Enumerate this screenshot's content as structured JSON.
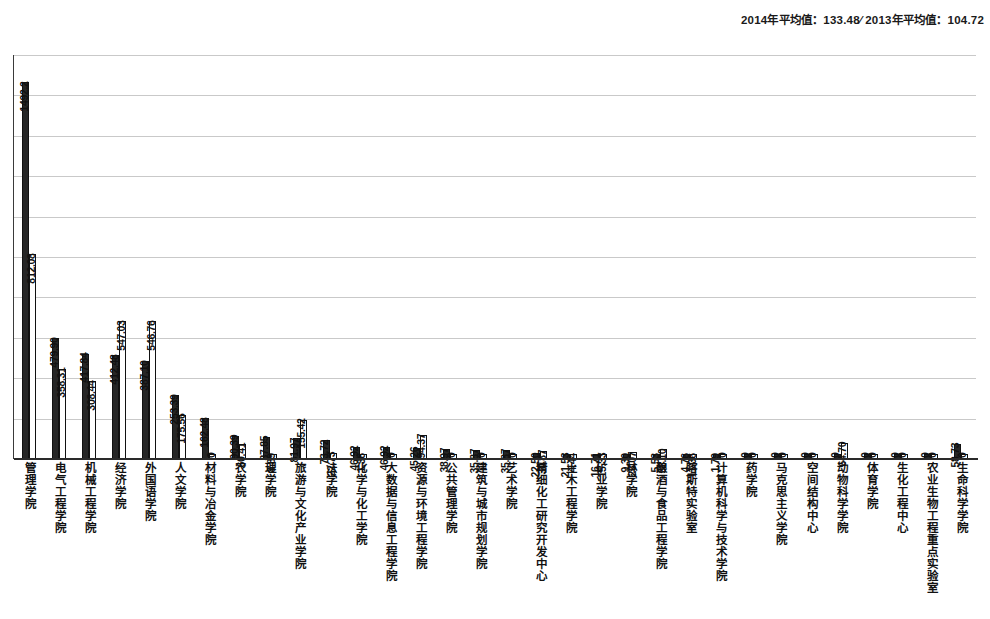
{
  "header": {
    "note": "2014年平均值：133.48∕ 2013年平均值：104.72"
  },
  "chart_data": {
    "type": "bar",
    "title": "",
    "subtitle": "",
    "xlabel": "",
    "ylabel": "",
    "grid": true,
    "legend_position": "none",
    "ylim": [
      0,
      1600
    ],
    "gridline_count": 10,
    "categories": [
      "管理学院",
      "电气工程学院",
      "机械工程学院",
      "经济学院",
      "外国语学院",
      "人文学院",
      "材料与冶金学院",
      "农学院",
      "理学院",
      "旅游与文化产业学院",
      "法学院",
      "化学与化工学院",
      "大数据与信息工程学院",
      "资源与环境工程学院",
      "公共管理学院",
      "建筑与城市规划学院",
      "艺术学院",
      "精细化工研究开发中心",
      "土木工程学院",
      "矿业学院",
      "林学院",
      "酿酒与食品工程学院",
      "喀斯特实验室",
      "计算机科学与技术学院",
      "药学院",
      "马克思主义学院",
      "空间结构中心",
      "动物科学学院",
      "体育学院",
      "生化工程中心",
      "农业生物工程重点实验室",
      "生命科学学院"
    ],
    "series": [
      {
        "name": "2014年",
        "average": 133.48,
        "values": [
          1492.2,
          479.9,
          417.84,
          412.48,
          387.1,
          253.39,
          162.48,
          90.39,
          87.85,
          81.97,
          73.72,
          46.92,
          46.92,
          45.26,
          38.97,
          35.87,
          35.87,
          22.5,
          21.53,
          16.71,
          9.3,
          5.53,
          4.76,
          1.79,
          0,
          0,
          0,
          0,
          0,
          0,
          0,
          58.73
        ]
      },
      {
        "name": "2013年",
        "average": 104.72,
        "values": [
          812.08,
          358.31,
          308.44,
          547.03,
          546.76,
          175.56,
          0,
          60.41,
          8.89,
          155.42,
          22.73,
          1.36,
          0,
          94.37,
          0,
          0,
          0,
          30.87,
          4.44,
          15.33,
          26.07,
          38.1,
          11.36,
          0,
          0,
          0,
          0,
          64.7,
          0,
          0,
          0,
          0
        ]
      }
    ],
    "value_labels_2014": [
      "1492.2",
      "479.90",
      "417.84",
      "412.48",
      "387.10",
      "253.39",
      "162.48",
      "90.39",
      "87.85",
      "81.97",
      "73.72",
      "46.92",
      "46.92",
      "45.26",
      "38.97",
      "35.87",
      "35.87",
      "22.50",
      "21.53",
      "16.71",
      "9.30",
      "5.53",
      "4.76",
      "1.79",
      "0",
      "0",
      "0",
      "0",
      "0",
      "0",
      "0",
      "58.73"
    ],
    "value_labels_2013": [
      "812.08",
      "358.31",
      "308.44",
      "547.03",
      "546.76",
      "175.56",
      "0",
      "60.41",
      "8.89",
      "155.42",
      "22.73",
      "1.36",
      "0",
      "94.37",
      "0",
      "0",
      "0",
      "30.87",
      "4.44",
      "15.33",
      "26.07",
      "38.10",
      "11.36",
      "0",
      "0",
      "0",
      "0",
      "64.70",
      "0",
      "0",
      "0",
      "0"
    ],
    "colors": {
      "series_2014": "#262626",
      "series_2013": "#ffffff",
      "bar_outline": "#111111",
      "gridline": "#c9c9c9",
      "axis": "#2a2a2a"
    }
  }
}
